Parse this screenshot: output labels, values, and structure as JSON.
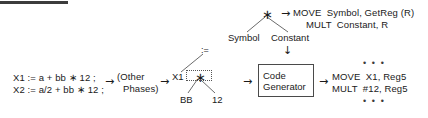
{
  "diagram": {
    "title_rule": "",
    "source_code": {
      "line1": "X1 := a + bb ∗ 12 ;",
      "line2": "X2 := a/2 + bb ∗ 12 ;"
    },
    "phases_box": {
      "line1": "(Other",
      "line2": "Phases)"
    },
    "ir_tree": {
      "root_label": ":=",
      "left_child": "X1",
      "op_node": "∗",
      "op_left": "BB",
      "op_right": "12"
    },
    "pattern_tree": {
      "root_label": "∗",
      "left_child": "Symbol",
      "right_child": "Constant"
    },
    "pattern_code": {
      "line1": "MOVE  Symbol, GetReg (R)",
      "line2": "MULT  Constant, R"
    },
    "code_generator": {
      "line1": "Code",
      "line2": "Generator"
    },
    "output_code": {
      "ellipsis_top": "• • •",
      "line1": "MOVE  X1, Reg5",
      "line2": "MULT  #12, Reg5",
      "ellipsis_bottom": "• • •"
    },
    "arrows": {
      "source_to_phases": "→",
      "phases_to_ir": "→",
      "ir_to_codegen": "→",
      "codegen_to_output": "→",
      "pattern_to_code": "→",
      "pattern_down": "↓"
    },
    "colors": {
      "ink": "#1a1a1a",
      "line": "#5a5a5a",
      "rule": "#3c3c3c",
      "background": "#ffffff"
    }
  }
}
